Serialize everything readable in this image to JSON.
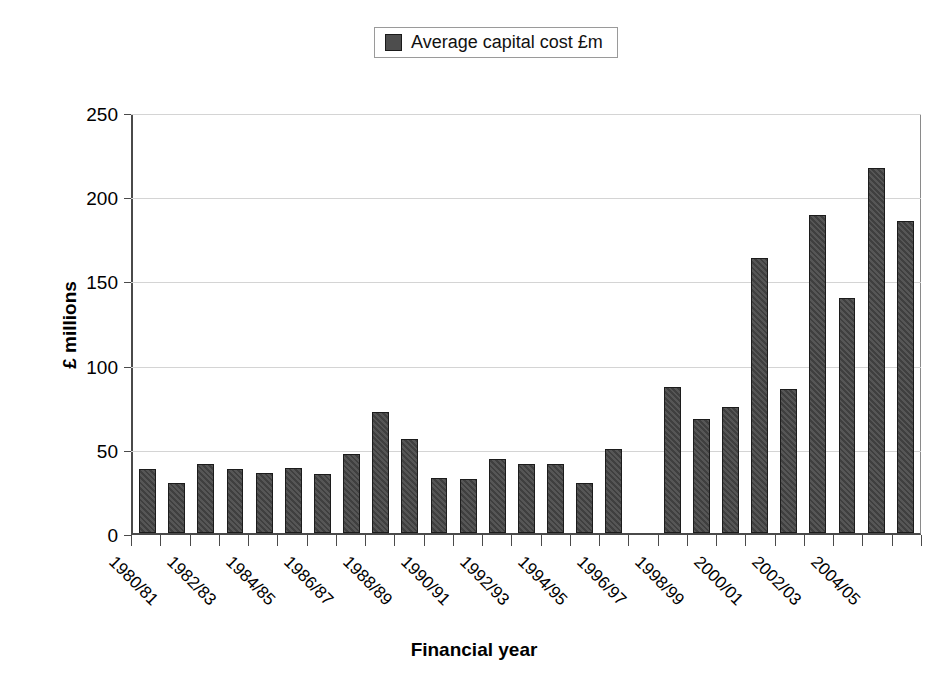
{
  "legend": {
    "entries": [
      {
        "label": "Average capital cost £m",
        "color": "#4d4d4d",
        "swatch_name": "legend-swatch-average-capital-cost"
      }
    ]
  },
  "axes": {
    "y_title": "£ millions",
    "x_title": "Financial year",
    "y_ticks": [
      "0",
      "50",
      "100",
      "150",
      "200",
      "250"
    ],
    "y_min": 0,
    "y_max": 250,
    "y_step": 50
  },
  "chart_data": {
    "type": "bar",
    "title": "",
    "subtitle": "",
    "xlabel": "Financial year",
    "ylabel": "£ millions",
    "ylim": [
      0,
      250
    ],
    "ytick_labels": [
      "0",
      "50",
      "100",
      "150",
      "200",
      "250"
    ],
    "grid": true,
    "legend_position": "top-center",
    "series": [
      {
        "name": "Average capital cost £m",
        "color": "#4d4d4d",
        "values": [
          38,
          30,
          41,
          38,
          36,
          39,
          35,
          47,
          72,
          56,
          33,
          32,
          44,
          41,
          41,
          30,
          50,
          null,
          87,
          68,
          75,
          164,
          86,
          190,
          140,
          218,
          186
        ]
      }
    ],
    "categories": [
      "1980/81",
      "1981/82",
      "1982/83",
      "1983/84",
      "1984/85",
      "1985/86",
      "1986/87",
      "1987/88",
      "1988/89",
      "1989/90",
      "1990/91",
      "1991/92",
      "1992/93",
      "1993/94",
      "1994/95",
      "1995/96",
      "1996/97",
      "1997/98",
      "1998/99",
      "1999/00",
      "2000/01",
      "2001/02",
      "2002/03",
      "2003/04",
      "2004/05",
      "2005/06",
      "2006/07"
    ],
    "visible_tick_labels": [
      {
        "category": "1980/81",
        "index": 0
      },
      {
        "category": "1982/83",
        "index": 2
      },
      {
        "category": "1984/85",
        "index": 4
      },
      {
        "category": "1986/87",
        "index": 6
      },
      {
        "category": "1988/89",
        "index": 8
      },
      {
        "category": "1990/91",
        "index": 10
      },
      {
        "category": "1992/93",
        "index": 12
      },
      {
        "category": "1994/95",
        "index": 14
      },
      {
        "category": "1996/97",
        "index": 16
      },
      {
        "category": "1998/99",
        "index": 18
      },
      {
        "category": "2000/01",
        "index": 20
      },
      {
        "category": "2002/03",
        "index": 22
      },
      {
        "category": "2004/05",
        "index": 24
      }
    ]
  }
}
